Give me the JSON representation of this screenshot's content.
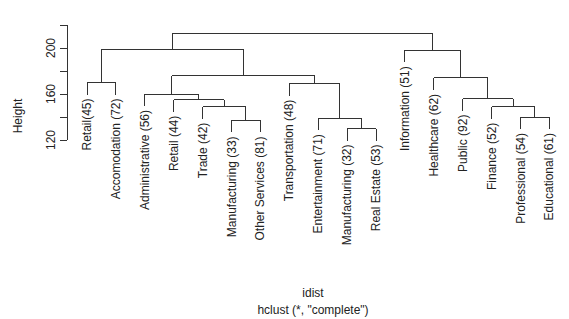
{
  "chart_data": {
    "type": "dendrogram",
    "xlabel": "idist",
    "sub": "hclust (*, \"complete\")",
    "ylabel": "Height",
    "yticks": [
      120,
      140,
      160,
      180,
      200,
      220
    ],
    "ytick_labels": [
      "120",
      "160",
      "200"
    ],
    "ylim": [
      120,
      220
    ],
    "leaves": [
      "Retail(45)",
      "Accomodation (72)",
      "Administrative (56)",
      "Retail (44)",
      "Trade (42)",
      "Manufacturing (33)",
      "Other Services (81)",
      "Transportation (48)",
      "Entertainment (71)",
      "Manufacturing (32)",
      "Real Estate (53)",
      "Information (51)",
      "Healthcare (62)",
      "Public (92)",
      "Finance (52)",
      "Professional (54)",
      "Educational (61)"
    ],
    "merges": [
      {
        "id": "m1",
        "left": "L5",
        "right": "L6",
        "height": 137
      },
      {
        "id": "m2",
        "left": "L4",
        "right": "m1",
        "height": 149
      },
      {
        "id": "m3",
        "left": "L3",
        "right": "m2",
        "height": 155
      },
      {
        "id": "m4",
        "left": "L2",
        "right": "m3",
        "height": 160
      },
      {
        "id": "m5",
        "left": "L9",
        "right": "L10",
        "height": 130
      },
      {
        "id": "m6",
        "left": "L8",
        "right": "m5",
        "height": 139
      },
      {
        "id": "m7",
        "left": "L7",
        "right": "m6",
        "height": 169
      },
      {
        "id": "m8",
        "left": "m4",
        "right": "m7",
        "height": 176
      },
      {
        "id": "m9",
        "left": "L0",
        "right": "L1",
        "height": 170
      },
      {
        "id": "m10",
        "left": "m9",
        "right": "m8",
        "height": 199
      },
      {
        "id": "m11",
        "left": "L15",
        "right": "L16",
        "height": 140
      },
      {
        "id": "m12",
        "left": "L14",
        "right": "m11",
        "height": 149
      },
      {
        "id": "m13",
        "left": "L13",
        "right": "m12",
        "height": 156
      },
      {
        "id": "m14",
        "left": "L12",
        "right": "m13",
        "height": 174
      },
      {
        "id": "m15",
        "left": "L11",
        "right": "m14",
        "height": 198
      },
      {
        "id": "m16",
        "left": "m10",
        "right": "m15",
        "height": 213
      }
    ]
  },
  "labels": {
    "ylabel": "Height",
    "xlabel": "idist",
    "sub": "hclust (*, \"complete\")"
  }
}
